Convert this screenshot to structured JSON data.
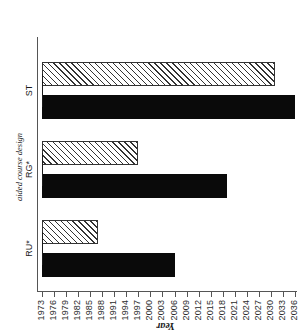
{
  "chart_data": {
    "type": "bar",
    "orientation": "horizontal",
    "title": "",
    "xlabel": "aided course design",
    "ylabel": "Year",
    "categories": [
      "RU*",
      "RG*",
      "ST"
    ],
    "series": [
      {
        "name": "solid",
        "values": [
          2006,
          2019,
          2036
        ]
      },
      {
        "name": "hatched",
        "values": [
          1987,
          1997,
          2031
        ]
      }
    ],
    "baseline": 1973,
    "ylim": [
      1973,
      2036
    ],
    "tick_labels": [
      "2036",
      "2033",
      "2030",
      "2027",
      "2024",
      "2021",
      "2018",
      "2015",
      "2012",
      "2009",
      "2006",
      "2003",
      "2000",
      "1997",
      "1994",
      "1991",
      "1988",
      "1985",
      "1982",
      "1979",
      "1976",
      "1973"
    ],
    "tick_values": [
      2036,
      2033,
      2030,
      2027,
      2024,
      2021,
      2018,
      2015,
      2012,
      2009,
      2006,
      2003,
      2000,
      1997,
      1994,
      1991,
      1988,
      1985,
      1982,
      1979,
      1976,
      1973
    ],
    "tick_step": 3,
    "grid": false,
    "legend": null,
    "colors": {
      "solid": "#0a0a0a",
      "hatched_edge": "#333333",
      "hatched_fill": "#ffffff",
      "axis": "#555555",
      "text": "#1a1a1a"
    }
  },
  "axes": {
    "value_axis_title": "Year",
    "category_axis_title": "aided course design"
  }
}
